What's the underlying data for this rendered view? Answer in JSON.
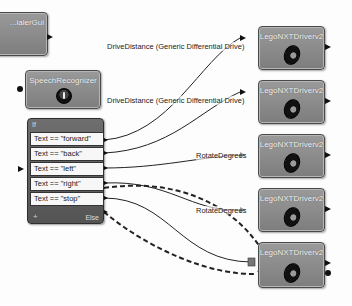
{
  "diagram": {
    "type": "Microsoft Robotics VPL dataflow diagram",
    "blocks": {
      "partial_top_left": {
        "title": "...ialerGui"
      },
      "speech": {
        "title": "SpeechRecognizer",
        "icon": "microphone-icon"
      },
      "if": {
        "title": "If",
        "conditions": [
          "Text == \"forward\"",
          "Text == \"back\"",
          "Text == \"left\"",
          "Text == \"right\"",
          "Text == \"stop\""
        ],
        "add_label": "+",
        "else_label": "Else"
      },
      "drives": [
        {
          "title": "LegoNXTDriverv2",
          "icon": "tire-icon"
        },
        {
          "title": "LegoNXTDriverv2",
          "icon": "tire-icon"
        },
        {
          "title": "LegoNXTDriverv2",
          "icon": "tire-icon"
        },
        {
          "title": "LegoNXTDriverv2",
          "icon": "tire-icon"
        },
        {
          "title": "LegoNXTDriverv2",
          "icon": "tire-icon"
        }
      ]
    },
    "wire_labels": [
      "DriveDistance (Generic Differential Drive)",
      "DriveDistance (Generic Differential Drive)",
      "RotateDegrees",
      "RotateDegrees"
    ],
    "colors": {
      "block_fill": "#8a8a8a",
      "if_fill": "#5e5e5e",
      "wire": "#222222",
      "background": "#fdfdfd"
    }
  }
}
